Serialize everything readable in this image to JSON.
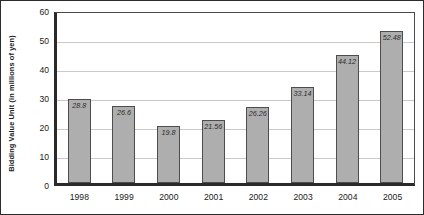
{
  "chart_data": {
    "type": "bar",
    "title": "",
    "xlabel": "",
    "ylabel": "Bidding Value Unit (in millions of yen)",
    "categories": [
      "1998",
      "1999",
      "2000",
      "2001",
      "2002",
      "2003",
      "2004",
      "2005"
    ],
    "values": [
      28.8,
      26.6,
      19.8,
      21.56,
      26.26,
      33.14,
      44.12,
      52.48
    ],
    "value_labels": [
      "28.8",
      "26.6",
      "19.8",
      "21.56",
      "26.26",
      "33.14",
      "44.12",
      "52.48"
    ],
    "ylim": [
      0,
      60
    ],
    "yticks": [
      0,
      10,
      20,
      30,
      40,
      50,
      60
    ],
    "ytick_labels": [
      "0",
      "10",
      "20",
      "30",
      "40",
      "50",
      "60"
    ],
    "grid": true,
    "legend": null,
    "series_color": "#aeaeae",
    "series_border_color": "#4d4d4d",
    "gridline_color": "#c9c9c9",
    "axis_color": "#2a2a2a",
    "background": "#ffffff"
  }
}
